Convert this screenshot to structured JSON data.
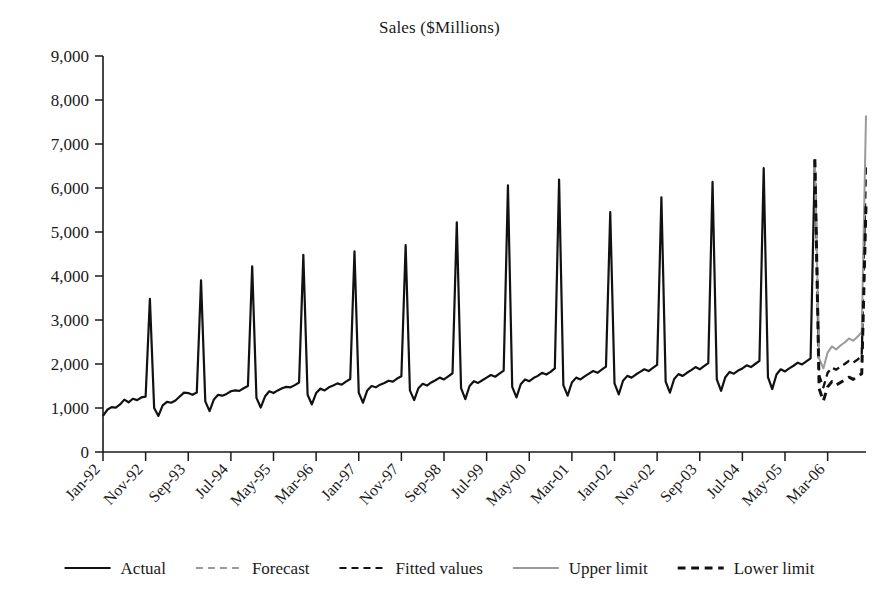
{
  "chart_data": {
    "type": "line",
    "title": "Sales ($Millions)",
    "xlabel": "",
    "ylabel": "",
    "ylim": [
      0,
      9000
    ],
    "yticks": [
      0,
      1000,
      2000,
      3000,
      4000,
      5000,
      6000,
      7000,
      8000,
      9000
    ],
    "ytick_labels": [
      "0",
      "1,000",
      "2,000",
      "3,000",
      "4,000",
      "5,000",
      "6,000",
      "7,000",
      "8,000",
      "9,000"
    ],
    "grid": false,
    "legend_position": "bottom",
    "x_tick_labels": [
      "Jan-92",
      "Nov-92",
      "Sep-93",
      "Jul-94",
      "May-95",
      "Mar-96",
      "Jan-97",
      "Nov-97",
      "Sep-98",
      "Jul-99",
      "May-00",
      "Mar-01",
      "Jan-02",
      "Nov-02",
      "Sep-03",
      "Jul-04",
      "May-05",
      "Mar-06"
    ],
    "x_tick_interval_months": 10,
    "x_start": "Jan-92",
    "x_end": "Dec-06",
    "n_points": 180,
    "legend": [
      {
        "name": "Actual",
        "style": "solid",
        "color": "#111111",
        "width": 2.2
      },
      {
        "name": "Forecast",
        "style": "dashed",
        "color": "#9a9a9a",
        "width": 2.2
      },
      {
        "name": "Fitted values",
        "style": "dashed",
        "color": "#111111",
        "width": 2.2
      },
      {
        "name": "Upper limit",
        "style": "solid",
        "color": "#9a9a9a",
        "width": 2.0
      },
      {
        "name": "Lower limit",
        "style": "dashed",
        "color": "#111111",
        "width": 3.0
      }
    ],
    "series": [
      {
        "name": "Actual",
        "style": "solid",
        "color": "#111111",
        "start_index": 0,
        "values": [
          820,
          960,
          1020,
          1010,
          1080,
          1190,
          1130,
          1210,
          1180,
          1240,
          1260,
          3480,
          1000,
          820,
          1060,
          1140,
          1120,
          1170,
          1260,
          1350,
          1340,
          1300,
          1350,
          3900,
          1150,
          930,
          1190,
          1300,
          1280,
          1320,
          1380,
          1400,
          1390,
          1450,
          1500,
          4220,
          1230,
          1010,
          1260,
          1380,
          1340,
          1400,
          1450,
          1480,
          1470,
          1520,
          1580,
          4480,
          1300,
          1080,
          1340,
          1440,
          1400,
          1470,
          1510,
          1560,
          1530,
          1600,
          1660,
          4560,
          1350,
          1120,
          1400,
          1500,
          1470,
          1530,
          1570,
          1620,
          1600,
          1670,
          1720,
          4700,
          1400,
          1180,
          1450,
          1550,
          1510,
          1580,
          1630,
          1690,
          1650,
          1720,
          1790,
          5220,
          1450,
          1200,
          1500,
          1610,
          1570,
          1630,
          1690,
          1750,
          1710,
          1780,
          1850,
          6060,
          1480,
          1240,
          1540,
          1650,
          1610,
          1680,
          1730,
          1800,
          1760,
          1820,
          1900,
          6190,
          1520,
          1280,
          1580,
          1690,
          1650,
          1720,
          1780,
          1840,
          1800,
          1870,
          1940,
          5450,
          1560,
          1310,
          1620,
          1730,
          1690,
          1760,
          1820,
          1880,
          1840,
          1910,
          1980,
          5790,
          1600,
          1350,
          1660,
          1770,
          1730,
          1800,
          1860,
          1930,
          1880,
          1950,
          2020,
          6140,
          1650,
          1390,
          1700,
          1820,
          1780,
          1850,
          1900,
          1970,
          1930,
          2000,
          2070,
          6450,
          1700,
          1430,
          1760,
          1880,
          1830,
          1900,
          1960,
          2030,
          1990,
          2060,
          2130,
          6650
        ]
      },
      {
        "name": "Forecast",
        "style": "dashed",
        "color": "#9a9a9a",
        "start_index": 167,
        "values": [
          6650,
          1740,
          1470,
          1800,
          1920,
          1870,
          1940,
          2000,
          2070,
          2030,
          2100,
          2180,
          6560
        ]
      },
      {
        "name": "Fitted values",
        "style": "dashed",
        "color": "#111111",
        "start_index": 167,
        "values": [
          6650,
          1740,
          1470,
          1800,
          1920,
          1870,
          1940,
          2000,
          2070,
          2030,
          2100,
          2180,
          6560
        ]
      },
      {
        "name": "Upper limit",
        "style": "solid",
        "color": "#9a9a9a",
        "start_index": 167,
        "values": [
          6650,
          2130,
          1900,
          2260,
          2400,
          2330,
          2420,
          2490,
          2580,
          2530,
          2620,
          2720,
          7650
        ]
      },
      {
        "name": "Lower limit",
        "style": "dashed",
        "color": "#111111",
        "start_index": 167,
        "values": [
          6650,
          1440,
          1160,
          1480,
          1600,
          1520,
          1580,
          1640,
          1700,
          1650,
          1720,
          1780,
          5620
        ]
      }
    ]
  },
  "plot_geometry": {
    "left": 103,
    "right": 866,
    "top": 56,
    "bottom": 452
  }
}
